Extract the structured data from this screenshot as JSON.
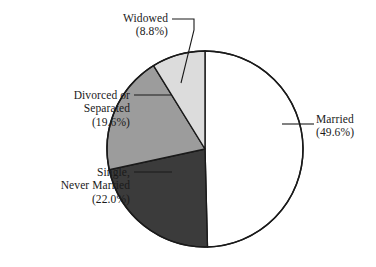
{
  "chart_data": {
    "type": "pie",
    "title": "",
    "subtitle": "",
    "xlabel": "",
    "ylabel": "",
    "legend_position": "none",
    "grid": false,
    "labels_outside": true,
    "start_angle_deg": 0,
    "direction": "clockwise",
    "categories": [
      "Married",
      "Single, Never Married",
      "Divorced or Separated",
      "Widowed"
    ],
    "values": [
      49.6,
      22.0,
      19.6,
      8.8
    ],
    "units": "percent",
    "slices": [
      {
        "name": "married",
        "label_lines": [
          "Married",
          "(49.6%)"
        ],
        "label_text": "Married (49.6%)",
        "value": 49.6,
        "value_text": "(49.6%)",
        "color": "#ffffff",
        "start_deg": 0,
        "end_deg": 178.56,
        "leader_side": "right"
      },
      {
        "name": "single-never-married",
        "label_lines": [
          "Single,",
          "Never Married",
          "(22.0%)"
        ],
        "label_text": "Single, Never Married (22.0%)",
        "value": 22.0,
        "value_text": "(22.0%)",
        "color": "#3b3b3b",
        "start_deg": 178.56,
        "end_deg": 257.76,
        "leader_side": "left"
      },
      {
        "name": "divorced-or-separated",
        "label_lines": [
          "Divorced or",
          "Separated",
          "(19.6%)"
        ],
        "label_text": "Divorced or Separated (19.6%)",
        "value": 19.6,
        "value_text": "(19.6%)",
        "color": "#9c9c9c",
        "start_deg": 257.76,
        "end_deg": 328.32,
        "leader_side": "left"
      },
      {
        "name": "widowed",
        "label_lines": [
          "Widowed",
          "(8.8%)"
        ],
        "label_text": "Widowed (8.8%)",
        "value": 8.8,
        "value_text": "(8.8%)",
        "color": "#dcdcdc",
        "start_deg": 328.32,
        "end_deg": 360.0,
        "leader_side": "top"
      }
    ]
  },
  "labels": {
    "widowed": {
      "line1": "Widowed",
      "line2": "(8.8%)"
    },
    "divorced": {
      "line1": "Divorced or",
      "line2": "Separated",
      "line3": "(19.6%)"
    },
    "single": {
      "line1": "Single,",
      "line2": "Never Married",
      "line3": "(22.0%)"
    },
    "married": {
      "line1": "Married",
      "line2": "(49.6%)"
    }
  },
  "colors": {
    "married": "#ffffff",
    "single": "#3b3b3b",
    "divorced": "#9c9c9c",
    "widowed": "#dcdcdc",
    "outline": "#1a1a1a",
    "leader": "#1a1a1a",
    "background": "#ffffff",
    "text": "#1a1a1a"
  }
}
